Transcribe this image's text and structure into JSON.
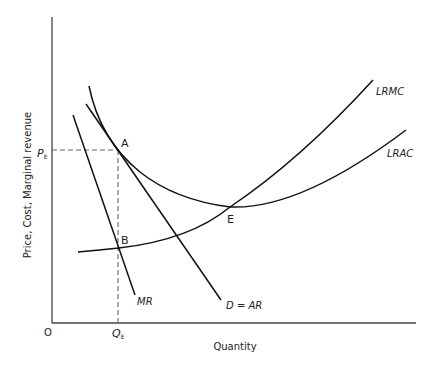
{
  "diagram": {
    "title": "",
    "y_axis_label": "Price, Cost, Marginal revenue",
    "x_axis_label": "Quantity",
    "origin_label": "O",
    "pe_label": {
      "main": "P",
      "sub": "E"
    },
    "qe_label": {
      "main": "Q",
      "sub": "E"
    },
    "point_labels": {
      "a": "A",
      "b": "B",
      "e": "E"
    },
    "curve_labels": {
      "lrmc": "LRMC",
      "lrac": "LRAC",
      "mr": "MR",
      "demand": "D = AR"
    },
    "colors": {
      "line": "#111111",
      "dash": "#666666",
      "text": "#222222"
    }
  }
}
